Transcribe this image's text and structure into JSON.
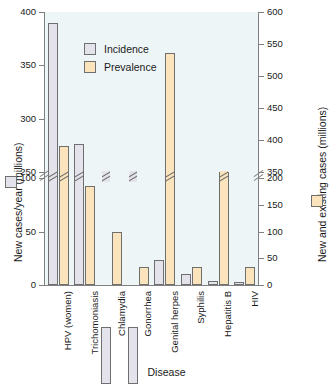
{
  "chart_data": {
    "type": "bar",
    "title": "",
    "xlabel": "Disease",
    "ylabel_left": "New cases/year (millions)",
    "ylabel_right": "New and existing cases (millions)",
    "categories": [
      "HPV (women)",
      "Trichomoniasis",
      "Chlamydia",
      "Gonorrhea",
      "Genital herpes",
      "Syphilis",
      "Hepatitis B",
      "HIV"
    ],
    "series": [
      {
        "name": "Incidence",
        "axis": "left",
        "color": "#e4e2ea",
        "values": [
          390,
          276,
          105,
          105,
          23,
          10,
          4,
          3
        ]
      },
      {
        "name": "Prevalence",
        "axis": "right",
        "color": "#fbe3bc",
        "values": [
          390,
          185,
          100,
          33,
          536,
          33,
          350,
          33
        ]
      }
    ],
    "left_axis": {
      "ticks": [
        0,
        50,
        100,
        250,
        300,
        350,
        400
      ],
      "broken": true,
      "break_between": [
        100,
        250
      ],
      "lim": [
        0,
        400
      ]
    },
    "right_axis": {
      "ticks": [
        0,
        50,
        100,
        150,
        200,
        350,
        400,
        450,
        500,
        550,
        600
      ],
      "broken": true,
      "break_between": [
        200,
        350
      ],
      "lim": [
        0,
        600
      ]
    },
    "legend": {
      "position": "upper-left-inside",
      "entries": [
        "Incidence",
        "Prevalence"
      ]
    },
    "grid": false,
    "panel_color": "#eef5f7"
  }
}
